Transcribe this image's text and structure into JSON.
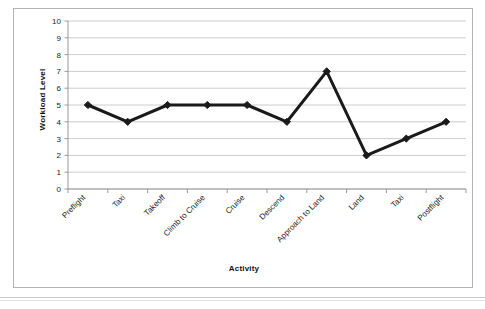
{
  "figure": {
    "background_color": "#ffffff",
    "frame_color": "#b4b4b4",
    "rule_color": "#c9c9c9"
  },
  "chart_data": {
    "type": "line",
    "title": "",
    "subtitle": "",
    "xlabel": "Activity",
    "ylabel": "Workload Level",
    "categories": [
      "Preflight",
      "Taxi",
      "Takeoff",
      "Climb to Cruise",
      "Cruise",
      "Descend",
      "Approach to Land",
      "Land",
      "Taxi",
      "Postflight"
    ],
    "values": [
      5,
      4,
      5,
      5,
      5,
      4,
      7,
      2,
      3,
      4
    ],
    "series": [
      {
        "name": "Workload Level",
        "values": [
          5,
          4,
          5,
          5,
          5,
          4,
          7,
          2,
          3,
          4
        ],
        "line_color": "#1a1a1a",
        "marker": "diamond",
        "marker_color": "#1a1a1a"
      }
    ],
    "ylim": [
      0,
      10
    ],
    "ytick_step": 1,
    "yticks": [
      0,
      1,
      2,
      3,
      4,
      5,
      6,
      7,
      8,
      9,
      10
    ],
    "ytick_labels": [
      "0",
      "1",
      "2",
      "3",
      "4",
      "5",
      "6",
      "7",
      "8",
      "9",
      "10"
    ],
    "grid": {
      "horizontal": true,
      "vertical": false,
      "color": "#bfbfbf"
    },
    "legend": {
      "visible": false,
      "position": "none"
    },
    "xtick_label_rotation": -45,
    "axis_line_color": "#9a9a9a"
  }
}
